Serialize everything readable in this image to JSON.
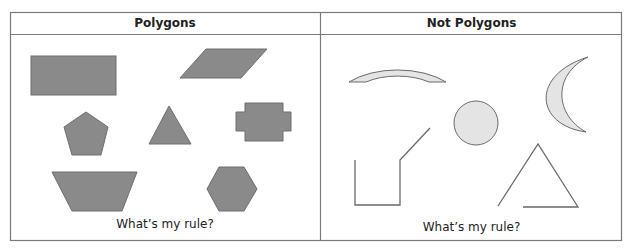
{
  "columns": [
    {
      "title": "Polygons",
      "caption": "What’s my rule?",
      "shapes": [
        {
          "name": "rectangle",
          "closed": true
        },
        {
          "name": "parallelogram",
          "closed": true
        },
        {
          "name": "pentagon",
          "closed": true
        },
        {
          "name": "triangle",
          "closed": true
        },
        {
          "name": "cross-shaped-polygon",
          "closed": true
        },
        {
          "name": "trapezoid",
          "closed": true
        },
        {
          "name": "hexagon",
          "closed": true
        }
      ]
    },
    {
      "title": "Not Polygons",
      "caption": "What’s my rule?",
      "shapes": [
        {
          "name": "arch",
          "closed": true,
          "curved": true
        },
        {
          "name": "crescent",
          "closed": true,
          "curved": true
        },
        {
          "name": "circle",
          "closed": true,
          "curved": true
        },
        {
          "name": "open-line-figure",
          "closed": false
        },
        {
          "name": "open-triangle",
          "closed": false
        }
      ]
    }
  ],
  "colors": {
    "polygon_fill": "#8a8a8a",
    "polygon_stroke": "#6e6e6e",
    "nonpolygon_fill": "#e4e4e4",
    "line_stroke": "#6a6a6a",
    "border": "#7a7a7a"
  }
}
